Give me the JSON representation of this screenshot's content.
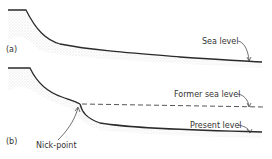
{
  "diagram": {
    "panels": [
      {
        "id": "a",
        "label": "(a)",
        "annotations": [
          {
            "text": "Sea level",
            "target": "sea-level-line"
          }
        ]
      },
      {
        "id": "b",
        "label": "(b)",
        "annotations": [
          {
            "text": "Former sea level",
            "target": "former-sea-level-line",
            "style": "dashed"
          },
          {
            "text": "Present level",
            "target": "present-level-line"
          },
          {
            "text": "Nick-point",
            "target": "nick-point"
          }
        ]
      }
    ],
    "colors": {
      "line": "#2a2a2a",
      "stipple": "#b8b8b8",
      "text": "#333333"
    }
  }
}
